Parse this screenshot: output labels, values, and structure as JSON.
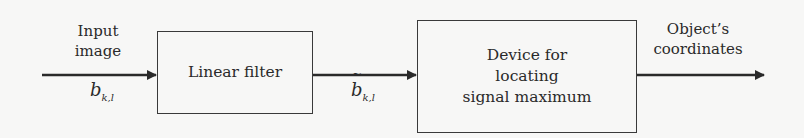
{
  "diagram": {
    "type": "block-diagram",
    "input": {
      "label_line1": "Input",
      "label_line2": "image",
      "symbol_base": "b",
      "symbol_sub": "k,l"
    },
    "blocks": [
      {
        "id": "linear-filter",
        "label": "Linear filter"
      },
      {
        "id": "max-locator",
        "label_line1": "Device for",
        "label_line2": "locating",
        "label_line3": "signal maximum"
      }
    ],
    "intermediate": {
      "symbol_base": "b",
      "symbol_sub": "k,l",
      "accent": "tilde"
    },
    "output": {
      "label_line1": "Object’s",
      "label_line2": "coordinates"
    },
    "edges": [
      {
        "from": "input",
        "to": "linear-filter"
      },
      {
        "from": "linear-filter",
        "to": "max-locator"
      },
      {
        "from": "max-locator",
        "to": "output"
      }
    ],
    "colors": {
      "line": "#2a2a2a",
      "background": "#f7f7f6"
    }
  }
}
